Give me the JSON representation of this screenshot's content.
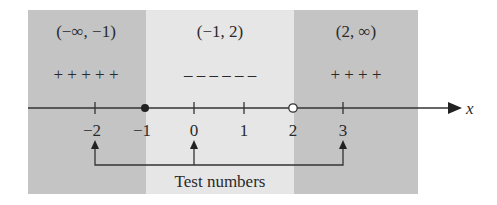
{
  "diagram": {
    "type": "sign-chart-number-line",
    "axis_label": "x",
    "colors": {
      "outer_region": "#c4c4c4",
      "middle_region": "#e6e6e6",
      "line": "#333333",
      "text": "#2a2a2a"
    },
    "intervals": [
      {
        "label": "(−∞, −1)",
        "signs": "+ + + + +",
        "shade": "dark"
      },
      {
        "label": "(−1, 2)",
        "signs": "– – – – – –",
        "shade": "light"
      },
      {
        "label": "(2, ∞)",
        "signs": "+ + + +",
        "shade": "dark"
      }
    ],
    "ticks": [
      {
        "value": "−2"
      },
      {
        "value": "−1"
      },
      {
        "value": "0"
      },
      {
        "value": "1"
      },
      {
        "value": "2"
      },
      {
        "value": "3"
      }
    ],
    "critical_points": [
      {
        "value": "−1",
        "marker": "filled"
      },
      {
        "value": "2",
        "marker": "open"
      }
    ],
    "test_numbers": [
      "−2",
      "0",
      "3"
    ],
    "test_numbers_label": "Test numbers"
  }
}
